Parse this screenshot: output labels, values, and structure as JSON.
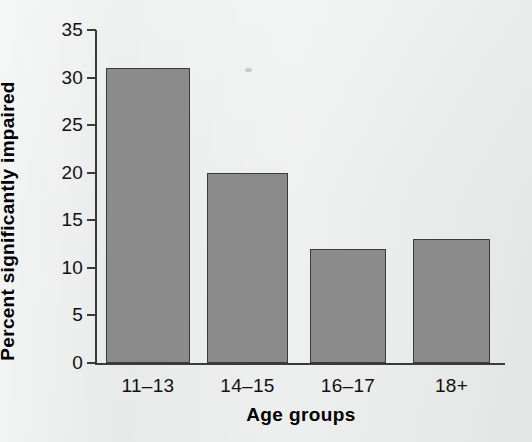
{
  "chart_data": {
    "type": "bar",
    "title": "",
    "xlabel": "Age groups",
    "ylabel": "Percent significantly impaired",
    "categories": [
      "11–13",
      "14–15",
      "16–17",
      "18+"
    ],
    "values": [
      31,
      20,
      12,
      13
    ],
    "ylim": [
      0,
      35
    ],
    "yticks": [
      0,
      5,
      10,
      15,
      20,
      25,
      30,
      35
    ],
    "ytick_labels": [
      "0",
      "5",
      "10",
      "15",
      "20",
      "25",
      "30",
      "35"
    ],
    "grid": false,
    "legend": null,
    "bar_color": "#8b8b8b",
    "bar_edge_color": "#3b3b3b",
    "background_color": "#ebecec",
    "axis_color": "#3a3a3a",
    "text_color": "#111111"
  }
}
